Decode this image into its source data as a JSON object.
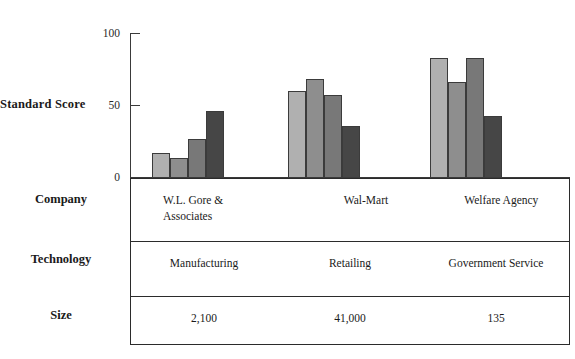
{
  "chart_data": {
    "type": "bar",
    "title": "",
    "xlabel": "",
    "ylabel": "Standard Score",
    "ylim": [
      0,
      100
    ],
    "yticks": [
      "0",
      "50",
      "100"
    ],
    "grid": false,
    "legend": "none",
    "categories": [
      "W.L. Gore & Associates",
      "Wal-Mart",
      "Welfare Agency"
    ],
    "series": [
      {
        "name": "bar-1",
        "color": "#b0b0b0",
        "values": [
          17,
          60,
          83
        ]
      },
      {
        "name": "bar-2",
        "color": "#8e8e8e",
        "values": [
          14,
          68,
          66
        ]
      },
      {
        "name": "bar-3",
        "color": "#787878",
        "values": [
          27,
          57,
          83
        ]
      },
      {
        "name": "bar-4",
        "color": "#464646",
        "values": [
          46,
          36,
          43
        ]
      }
    ]
  },
  "axis": {
    "y_title": "Standard Score",
    "tick_100": "100",
    "tick_50": "50",
    "tick_0": "0"
  },
  "table": {
    "rows": [
      {
        "label": "Company",
        "cells": [
          "W.L. Gore &\nAssociates",
          "Wal-Mart",
          "Welfare Agency"
        ]
      },
      {
        "label": "Technology",
        "cells": [
          "Manufacturing",
          "Retailing",
          "Government Service"
        ]
      },
      {
        "label": "Size",
        "cells": [
          "2,100",
          "41,000",
          "135"
        ]
      }
    ]
  },
  "colors": {
    "bar_light": "#b0b0b0",
    "bar_medium": "#8e8e8e",
    "bar_mid_dark": "#787878",
    "bar_dark": "#464646",
    "axis": "#3a3a3a",
    "border": "#2b2b2b",
    "background": "#ffffff"
  }
}
